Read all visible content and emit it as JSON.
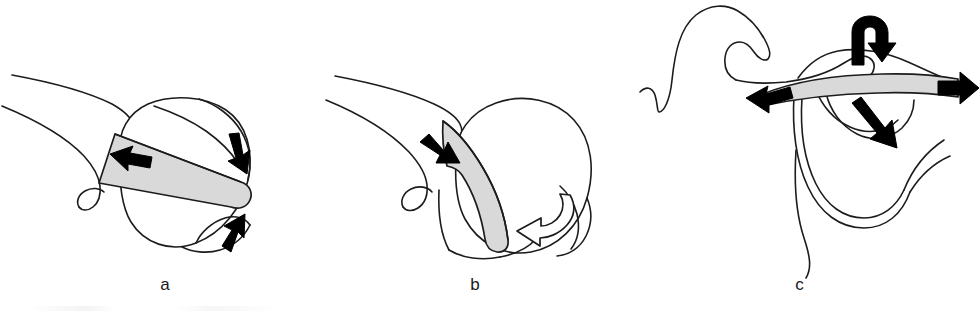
{
  "figure": {
    "type": "anatomical-line-drawing",
    "background_color": "#ffffff",
    "line_color": "#1c1c1c",
    "band_fill_color": "#d9d9d9",
    "arrow_fill_color": "#000000",
    "panel_count": 3
  },
  "panels": [
    {
      "id": "a",
      "caption": "a",
      "subject": "joint with gray band crossing horizontally over the head",
      "band": {
        "name": "ligament-band",
        "orientation": "horizontal",
        "fill": "#d9d9d9"
      },
      "arrows": [
        {
          "name": "arrow-left-on-band",
          "style": "solid",
          "direction": "left"
        },
        {
          "name": "arrow-upper-right-down",
          "style": "solid",
          "direction": "down-right"
        },
        {
          "name": "arrow-lower-right-up",
          "style": "solid",
          "direction": "up-right"
        }
      ]
    },
    {
      "id": "b",
      "caption": "b",
      "subject": "joint with gray band angled down across the head",
      "band": {
        "name": "ligament-band",
        "orientation": "diagonal",
        "fill": "#d9d9d9"
      },
      "arrows": [
        {
          "name": "arrow-on-band-down-right",
          "style": "solid",
          "direction": "down-right"
        },
        {
          "name": "arrow-rotation-hollow",
          "style": "hollow",
          "direction": "curved-down-left"
        }
      ]
    },
    {
      "id": "c",
      "caption": "c",
      "subject": "lateral view with long curving structure and horizontal gray band",
      "band": {
        "name": "ligament-band",
        "orientation": "horizontal",
        "fill": "#d9d9d9"
      },
      "arrows": [
        {
          "name": "arrow-hook-top",
          "style": "solid",
          "direction": "curled-right"
        },
        {
          "name": "arrow-band-right",
          "style": "solid",
          "direction": "right"
        },
        {
          "name": "arrow-band-left",
          "style": "solid",
          "direction": "left"
        },
        {
          "name": "arrow-inner-down-right",
          "style": "solid",
          "direction": "down-right"
        }
      ]
    }
  ]
}
